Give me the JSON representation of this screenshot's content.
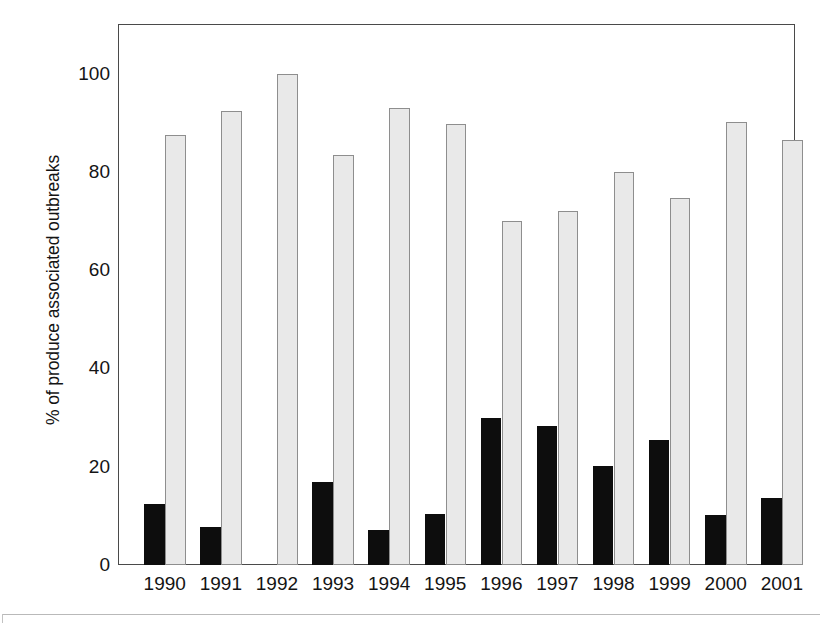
{
  "chart_data": {
    "type": "bar",
    "title": "",
    "subtitle": "",
    "xlabel": "",
    "ylabel": "% of produce associated outbreaks",
    "categories": [
      "1990",
      "1991",
      "1992",
      "1993",
      "1994",
      "1995",
      "1996",
      "1997",
      "1998",
      "1999",
      "2000",
      "2001"
    ],
    "series": [
      {
        "name": "black-series",
        "color": "#0d0d0d",
        "values": [
          12.5,
          7.8,
          0,
          16.8,
          7.2,
          10.4,
          30.0,
          28.2,
          20.2,
          25.5,
          10.1,
          13.6
        ]
      },
      {
        "name": "gray-series",
        "color": "#e9e9e9",
        "values": [
          87.5,
          92.4,
          100.0,
          83.4,
          92.9,
          89.8,
          70.0,
          72.0,
          80.0,
          74.7,
          90.2,
          86.4
        ]
      }
    ],
    "ylim": [
      0,
      108
    ],
    "yticks": [
      0,
      20,
      40,
      60,
      80,
      100
    ],
    "ytick_labels": [
      "0",
      "20",
      "40",
      "60",
      "80",
      "100"
    ],
    "grid": false,
    "legend": "none",
    "axis_frame": "full-box"
  },
  "axis": {
    "y_title": "% of produce associated outbreaks",
    "tick_0": "0",
    "tick_20": "20",
    "tick_40": "40",
    "tick_60": "60",
    "tick_80": "80",
    "tick_100": "100"
  },
  "colors": {
    "dark_bar": "#0d0d0d",
    "light_bar": "#e9e9e9",
    "light_bar_border": "#8e8e8e",
    "axis": "#4a4a4a",
    "text": "#141414",
    "background": "#ffffff",
    "rule": "#b9b9b9"
  }
}
